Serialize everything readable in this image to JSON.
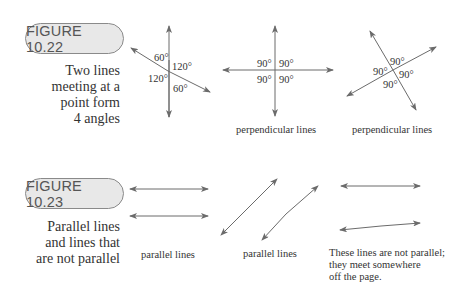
{
  "figures": [
    {
      "id_label": "FIGURE 10.22",
      "caption_lines": [
        "Two lines",
        "meeting at a",
        "point form",
        "4 angles"
      ],
      "diagrams": [
        {
          "angles": [
            "60°",
            "120°",
            "120°",
            "60°"
          ],
          "label": ""
        },
        {
          "angles": [
            "90°",
            "90°",
            "90°",
            "90°"
          ],
          "label": "perpendicular lines"
        },
        {
          "angles": [
            "90°",
            "90°",
            "90°",
            "90°"
          ],
          "label": "perpendicular lines"
        }
      ]
    },
    {
      "id_label": "FIGURE 10.23",
      "caption_lines": [
        "Parallel lines",
        "and lines that",
        "are not parallel"
      ],
      "diagrams": [
        {
          "label": "parallel lines"
        },
        {
          "label": "parallel lines"
        },
        {
          "label_lines": [
            "These lines are not parallel;",
            "they meet somewhere",
            "off the page."
          ]
        }
      ]
    }
  ],
  "colors": {
    "line": "#6b6b6b",
    "pill_fill": "#e8e8e8",
    "pill_border": "#8a8a8a"
  }
}
